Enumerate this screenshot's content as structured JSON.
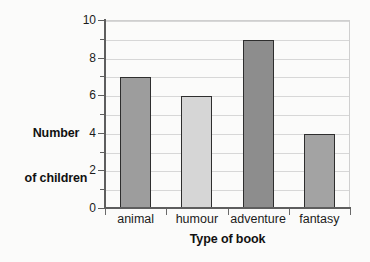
{
  "chart_data": {
    "type": "bar",
    "title": "",
    "subtitle": "",
    "xlabel": "Type of book",
    "ylabel": "Number\nof children",
    "ylabel_lines": [
      "Number",
      "of children"
    ],
    "categories": [
      "animal",
      "humour",
      "adventure",
      "fantasy"
    ],
    "values": [
      7,
      6,
      9,
      4
    ],
    "bar_colors": [
      "#9d9d9d",
      "#d6d6d6",
      "#8d8d8d",
      "#a3a3a3"
    ],
    "bar_border_color": "#2e2e2e",
    "ylim": [
      0,
      10
    ],
    "ytick_major": [
      0,
      2,
      4,
      6,
      8,
      10
    ],
    "ytick_minor": [
      1,
      3,
      5,
      7,
      9
    ],
    "ytick_labels": [
      "0",
      "2",
      "4",
      "6",
      "8",
      "10"
    ],
    "gridlines": [
      1,
      2,
      3,
      4,
      5,
      6,
      7,
      8,
      9,
      10
    ],
    "grid": true,
    "grid_color": "#d7d7d7",
    "legend": null,
    "legend_position": "none",
    "axis_color": "#5e5e5e",
    "background_color": "#fbfbfa",
    "series": [
      {
        "name": "Number of children",
        "values": [
          7,
          6,
          9,
          4
        ]
      }
    ]
  }
}
